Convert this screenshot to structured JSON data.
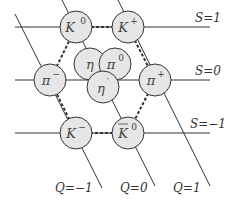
{
  "diagram": {
    "strangeness_lines": [
      {
        "label": "S=1",
        "y": 27
      },
      {
        "label": "S=0",
        "y": 80
      },
      {
        "label": "S=−1",
        "y": 133
      }
    ],
    "charge_lines": [
      {
        "label": "Q=−1"
      },
      {
        "label": "Q=0"
      },
      {
        "label": "Q=1"
      }
    ],
    "nodes": [
      {
        "id": "K0",
        "base": "K",
        "sup": "0",
        "bar": false,
        "x": 76,
        "y": 27
      },
      {
        "id": "Kplus",
        "base": "K",
        "sup": "+",
        "bar": false,
        "x": 128,
        "y": 27
      },
      {
        "id": "piminus",
        "base": "π",
        "sup": "−",
        "bar": false,
        "x": 50,
        "y": 80
      },
      {
        "id": "eta",
        "base": "η",
        "sup": "",
        "bar": false,
        "x": 90,
        "y": 64
      },
      {
        "id": "pi0",
        "base": "π",
        "sup": "0",
        "bar": false,
        "x": 115,
        "y": 64
      },
      {
        "id": "etaprime",
        "base": "η",
        "sup": "′",
        "bar": false,
        "x": 103,
        "y": 87
      },
      {
        "id": "piplus",
        "base": "π",
        "sup": "+",
        "bar": false,
        "x": 155,
        "y": 80
      },
      {
        "id": "Kminus",
        "base": "K",
        "sup": "−",
        "bar": false,
        "x": 76,
        "y": 133
      },
      {
        "id": "K0bar",
        "base": "K",
        "sup": "0",
        "bar": true,
        "x": 128,
        "y": 133
      }
    ],
    "colors": {
      "node_fill": "#e6e6e6",
      "stroke": "#333333"
    }
  }
}
